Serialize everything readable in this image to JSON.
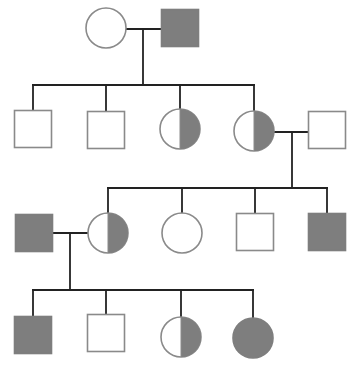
{
  "colors": {
    "background": "#ffffff",
    "affected_fill": "#7e7e7e",
    "outline": "#8a8a8a",
    "line": "#222222"
  },
  "legend_semantics": {
    "square": "male",
    "circle": "female",
    "filled": "affected",
    "half_filled": "carrier",
    "open": "unaffected"
  },
  "individuals": [
    {
      "id": "I-1",
      "generation": 1,
      "sex": "female",
      "status": "unaffected",
      "cx": 106,
      "cy": 28
    },
    {
      "id": "I-2",
      "generation": 1,
      "sex": "male",
      "status": "affected",
      "cx": 180,
      "cy": 28
    },
    {
      "id": "II-1",
      "generation": 2,
      "sex": "male",
      "status": "unaffected",
      "cx": 33,
      "cy": 129
    },
    {
      "id": "II-2",
      "generation": 2,
      "sex": "male",
      "status": "unaffected",
      "cx": 106,
      "cy": 130
    },
    {
      "id": "II-3",
      "generation": 2,
      "sex": "female",
      "status": "carrier",
      "cx": 180,
      "cy": 129
    },
    {
      "id": "II-4",
      "generation": 2,
      "sex": "female",
      "status": "carrier",
      "cx": 254,
      "cy": 131
    },
    {
      "id": "II-5",
      "generation": 2,
      "sex": "male",
      "status": "unaffected",
      "cx": 327,
      "cy": 130
    },
    {
      "id": "III-1",
      "generation": 3,
      "sex": "male",
      "status": "affected",
      "cx": 34,
      "cy": 233
    },
    {
      "id": "III-2",
      "generation": 3,
      "sex": "female",
      "status": "carrier",
      "cx": 108,
      "cy": 233
    },
    {
      "id": "III-3",
      "generation": 3,
      "sex": "female",
      "status": "unaffected",
      "cx": 182,
      "cy": 233
    },
    {
      "id": "III-4",
      "generation": 3,
      "sex": "male",
      "status": "unaffected",
      "cx": 255,
      "cy": 232
    },
    {
      "id": "III-5",
      "generation": 3,
      "sex": "male",
      "status": "affected",
      "cx": 327,
      "cy": 232
    },
    {
      "id": "IV-1",
      "generation": 4,
      "sex": "male",
      "status": "affected",
      "cx": 33,
      "cy": 335
    },
    {
      "id": "IV-2",
      "generation": 4,
      "sex": "male",
      "status": "unaffected",
      "cx": 106,
      "cy": 333
    },
    {
      "id": "IV-3",
      "generation": 4,
      "sex": "female",
      "status": "carrier",
      "cx": 181,
      "cy": 337
    },
    {
      "id": "IV-4",
      "generation": 4,
      "sex": "female",
      "status": "affected",
      "cx": 253,
      "cy": 338
    }
  ],
  "unions": [
    {
      "partners": [
        "I-1",
        "I-2"
      ],
      "line": [
        [
          126,
          29
        ],
        [
          161,
          29
        ]
      ],
      "drop": [
        [
          143,
          29
        ],
        [
          143,
          85
        ]
      ]
    },
    {
      "partners": [
        "II-4",
        "II-5"
      ],
      "line": [
        [
          274,
          132
        ],
        [
          309,
          132
        ]
      ],
      "drop": [
        [
          292,
          132
        ],
        [
          292,
          188
        ]
      ]
    },
    {
      "partners": [
        "III-1",
        "III-2"
      ],
      "line": [
        [
          53,
          233
        ],
        [
          88,
          233
        ]
      ],
      "drop": [
        [
          70,
          233
        ],
        [
          70,
          290
        ]
      ]
    }
  ],
  "sibships": [
    {
      "parents": "I-1 x I-2",
      "bar_y": 85,
      "bar_x": [
        33,
        254
      ],
      "children": [
        {
          "id": "II-1",
          "x": 33,
          "top": 110
        },
        {
          "id": "II-2",
          "x": 106,
          "top": 111
        },
        {
          "id": "II-3",
          "x": 180,
          "top": 109
        },
        {
          "id": "II-4",
          "x": 254,
          "top": 111
        }
      ]
    },
    {
      "parents": "II-4 x II-5",
      "bar_y": 188,
      "bar_x": [
        108,
        327
      ],
      "children": [
        {
          "id": "III-2",
          "x": 108,
          "top": 213
        },
        {
          "id": "III-3",
          "x": 182,
          "top": 213
        },
        {
          "id": "III-4",
          "x": 255,
          "top": 214
        },
        {
          "id": "III-5",
          "x": 327,
          "top": 214
        }
      ]
    },
    {
      "parents": "III-1 x III-2",
      "bar_y": 290,
      "bar_x": [
        33,
        253
      ],
      "children": [
        {
          "id": "IV-1",
          "x": 33,
          "top": 316
        },
        {
          "id": "IV-2",
          "x": 106,
          "top": 314
        },
        {
          "id": "IV-3",
          "x": 181,
          "top": 317
        },
        {
          "id": "IV-4",
          "x": 253,
          "top": 318
        }
      ]
    }
  ],
  "symbol_size": 37,
  "circle_radius": 20
}
